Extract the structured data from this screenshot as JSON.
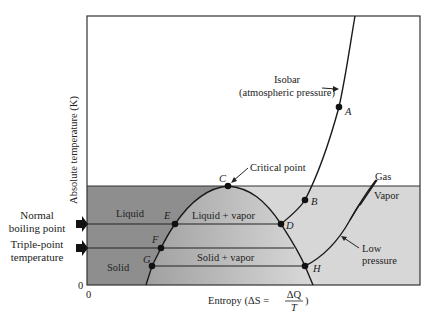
{
  "diagram": {
    "y_axis_label": "Absolute temperature (K)",
    "x_axis_label_prefix": "Entropy (ΔS = ",
    "x_axis_fraction_num": "ΔQ",
    "x_axis_fraction_den": "T",
    "x_axis_label_suffix": ")",
    "x_origin_label": "0",
    "y_origin_label": "0",
    "regions": {
      "gas": "Gas",
      "vapor": "Vapor",
      "liquid": "Liquid",
      "liquid_vapor": "Liquid + vapor",
      "solid": "Solid",
      "solid_vapor": "Solid + vapor"
    },
    "annotations": {
      "isobar_line1": "Isobar",
      "isobar_line2": "(atmospheric pressure)",
      "critical_point": "Critical point",
      "low_pressure_line1": "Low",
      "low_pressure_line2": "pressure"
    },
    "side_labels": {
      "normal_boiling_line1": "Normal",
      "normal_boiling_line2": "boiling point",
      "triple_point_line1": "Triple-point",
      "triple_point_line2": "temperature"
    },
    "points": {
      "A": "A",
      "B": "B",
      "C": "C",
      "D": "D",
      "E": "E",
      "F": "F",
      "G": "G",
      "H": "H"
    },
    "colors": {
      "frame": "#333333",
      "dark_region": "#8f8f8f",
      "light_region": "#d6d6d6",
      "curve": "#1a1a1a",
      "background": "#ffffff"
    }
  }
}
